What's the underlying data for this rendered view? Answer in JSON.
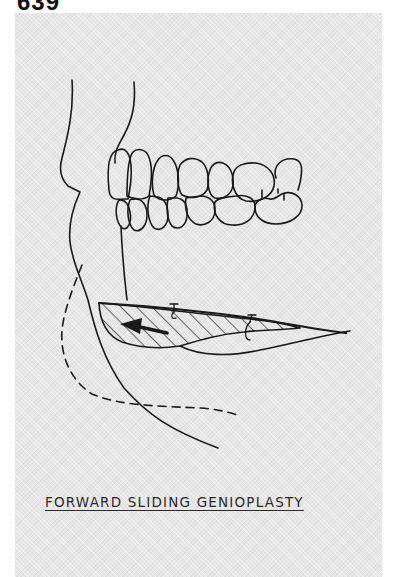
{
  "page": {
    "number": "639"
  },
  "figure": {
    "caption": "FORWARD SLIDING GENIOPLASTY",
    "elements": [
      {
        "name": "facial-soft-tissue-profile",
        "style": "solid"
      },
      {
        "name": "upper-incisor-root-line",
        "style": "solid"
      },
      {
        "name": "upper-dentition",
        "teeth_count": 6
      },
      {
        "name": "lower-dentition",
        "teeth_count": 7
      },
      {
        "name": "osteotomy-segment",
        "style": "hatched"
      },
      {
        "name": "advancement-arrow",
        "direction": "left"
      },
      {
        "name": "fixation-wires",
        "count": 2
      },
      {
        "name": "original-chin-outline",
        "style": "solid"
      },
      {
        "name": "advanced-chin-outline",
        "style": "dashed"
      }
    ],
    "colors": {
      "ink": "#1a1a1a",
      "panel": "#e7e7e7"
    }
  }
}
